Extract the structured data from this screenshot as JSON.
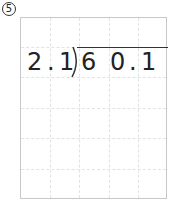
{
  "problem": {
    "number_label": "⑤",
    "divisor": [
      "2",
      ".",
      "1"
    ],
    "dividend": [
      "6",
      "0",
      ".",
      "1"
    ]
  },
  "colors": {
    "text": "#222222",
    "grid": "#e2e2e2",
    "border": "#c8c8c8"
  }
}
